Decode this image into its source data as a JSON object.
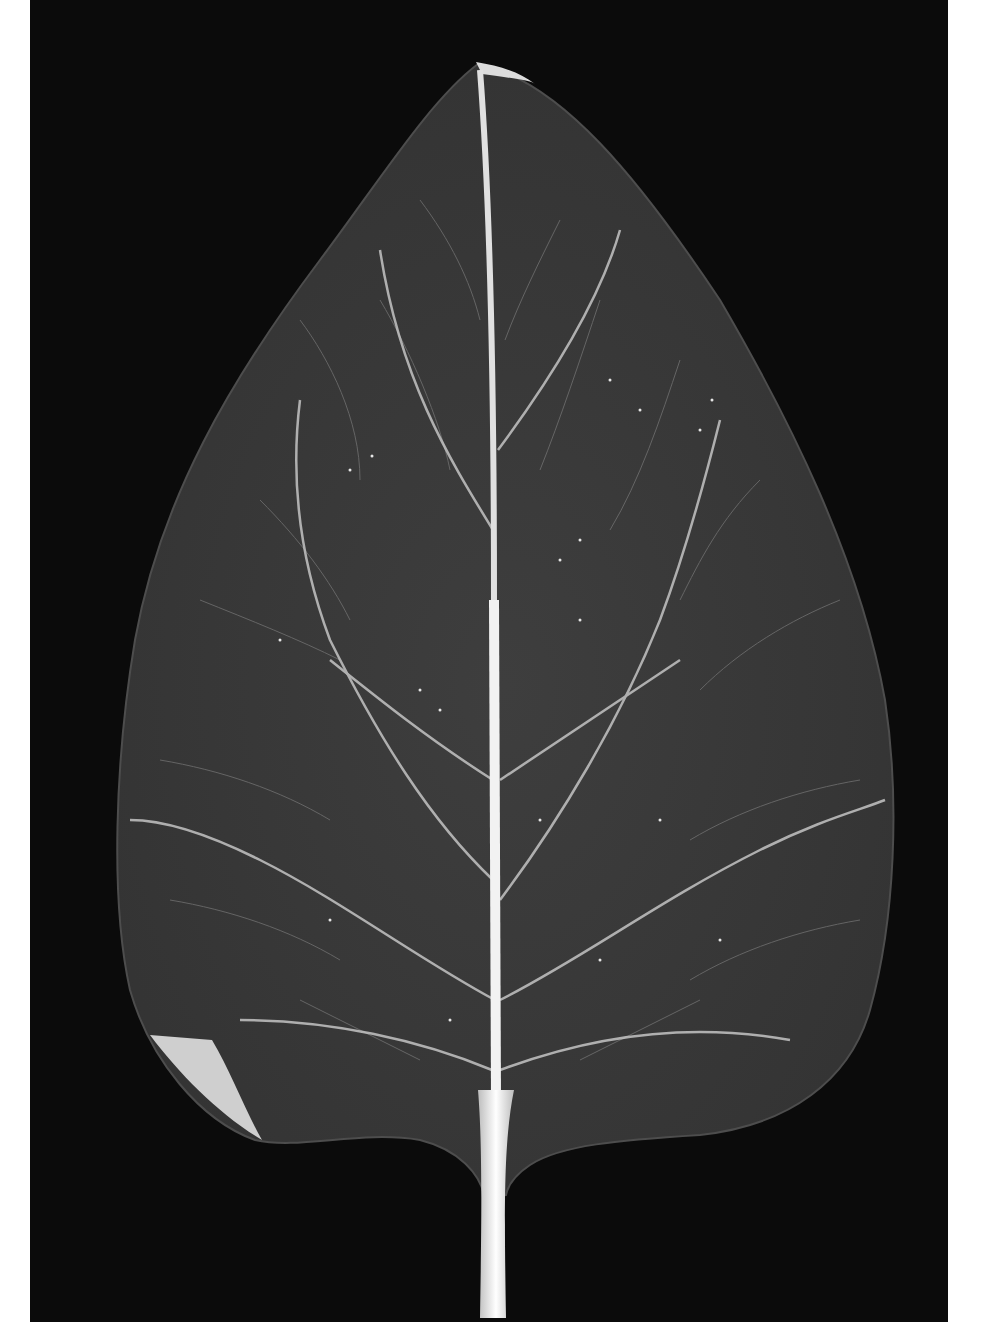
{
  "figure": {
    "background_color": "#0b0b0b",
    "leaf_color": "#3a3a3a",
    "vein_color": "#cfcfcf",
    "petiole_color": "#f2f2f2",
    "caption": ""
  }
}
